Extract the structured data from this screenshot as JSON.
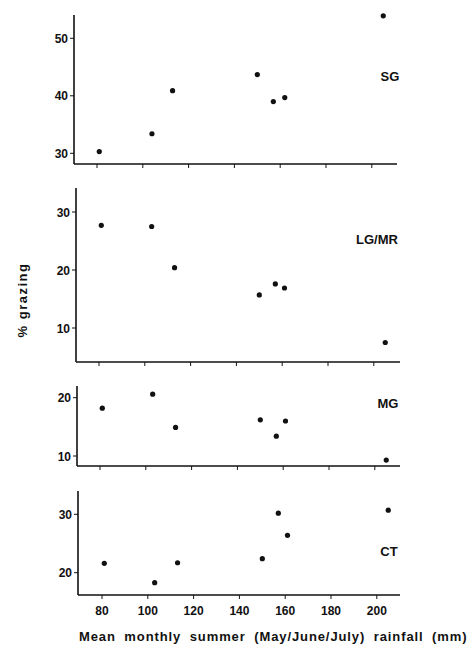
{
  "figure": {
    "ylabel": "% grazing",
    "xlabel": "Mean monthly summer (May/June/July) rainfall (mm)",
    "x_ticks": [
      80,
      100,
      120,
      140,
      160,
      180,
      200
    ],
    "colors": {
      "ink": "#111111",
      "background": "#ffffff"
    }
  },
  "chart_data": [
    {
      "type": "scatter",
      "title": "SG",
      "xlabel": "Mean monthly summer (May/June/July) rainfall (mm)",
      "ylabel": "% grazing",
      "x": [
        81,
        104,
        113,
        150,
        157,
        162,
        205
      ],
      "y": [
        30.3,
        33.4,
        40.9,
        43.7,
        39.0,
        39.7,
        53.9
      ],
      "y_ticks": [
        30,
        40,
        50
      ],
      "ylim": [
        28,
        54.5
      ],
      "xlim": [
        70,
        210
      ],
      "grid": false,
      "layout": {
        "left": 74,
        "top": 15,
        "bottom": 164,
        "right": 397,
        "x80": 97,
        "px_per_mm": 2.29,
        "y_ref": [
          30,
          153.3
        ],
        "px_per_unit": 5.75,
        "label_x": 390,
        "label_y": 81
      }
    },
    {
      "type": "scatter",
      "title": "LG/MR",
      "xlabel": "Mean monthly summer (May/June/July) rainfall (mm)",
      "ylabel": "% grazing",
      "x": [
        81,
        103,
        113,
        150,
        157,
        161,
        205
      ],
      "y": [
        27.7,
        27.5,
        20.4,
        15.7,
        17.6,
        16.9,
        7.5
      ],
      "y_ticks": [
        10,
        20,
        30
      ],
      "ylim": [
        4,
        34
      ],
      "xlim": [
        70,
        210
      ],
      "grid": false,
      "layout": {
        "left": 76,
        "top": 188,
        "bottom": 362,
        "right": 400,
        "x80": 99,
        "px_per_mm": 2.29,
        "y_ref": [
          10,
          328
        ],
        "px_per_unit": 5.8,
        "label_x": 377,
        "label_y": 244
      }
    },
    {
      "type": "scatter",
      "title": "MG",
      "xlabel": "Mean monthly summer (May/June/July) rainfall (mm)",
      "ylabel": "% grazing",
      "x": [
        81,
        103,
        113,
        150,
        157,
        161,
        205
      ],
      "y": [
        18.2,
        20.6,
        14.9,
        16.2,
        13.4,
        16.0,
        9.3
      ],
      "y_ticks": [
        10,
        20
      ],
      "ylim": [
        8.3,
        22
      ],
      "xlim": [
        70,
        210
      ],
      "grid": false,
      "layout": {
        "left": 77,
        "top": 386,
        "bottom": 466,
        "right": 400,
        "x80": 100,
        "px_per_mm": 2.29,
        "y_ref": [
          10,
          456
        ],
        "px_per_unit": 5.83,
        "label_x": 388,
        "label_y": 408
      }
    },
    {
      "type": "scatter",
      "title": "CT",
      "xlabel": "Mean monthly summer (May/June/July) rainfall (mm)",
      "ylabel": "% grazing",
      "x": [
        81,
        103,
        113,
        150,
        157,
        161,
        205
      ],
      "y": [
        21.6,
        18.3,
        21.7,
        22.4,
        30.2,
        26.4,
        30.7
      ],
      "y_ticks": [
        20,
        30
      ],
      "ylim": [
        16,
        34
      ],
      "xlim": [
        70,
        210
      ],
      "grid": false,
      "x_tick_labels_shown": true,
      "layout": {
        "left": 78,
        "top": 491,
        "bottom": 595,
        "right": 400,
        "x80": 102,
        "px_per_mm": 2.29,
        "y_ref": [
          20,
          572.7
        ],
        "px_per_unit": 5.84,
        "label_x": 389,
        "label_y": 556
      }
    }
  ]
}
